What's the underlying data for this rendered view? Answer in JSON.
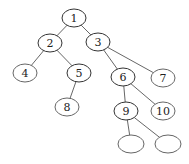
{
  "diagram": {
    "type": "binary-tree",
    "nodes": [
      {
        "id": "n1",
        "label": "1",
        "cx": 74,
        "cy": 18,
        "rx": 12,
        "ry": 9
      },
      {
        "id": "n2",
        "label": "2",
        "cx": 50,
        "cy": 43,
        "rx": 12,
        "ry": 9
      },
      {
        "id": "n3",
        "label": "3",
        "cx": 98,
        "cy": 42,
        "rx": 12,
        "ry": 9
      },
      {
        "id": "n4",
        "label": "4",
        "cx": 25,
        "cy": 73,
        "rx": 12,
        "ry": 9
      },
      {
        "id": "n5",
        "label": "5",
        "cx": 79,
        "cy": 73,
        "rx": 12,
        "ry": 9
      },
      {
        "id": "n6",
        "label": "6",
        "cx": 123,
        "cy": 77,
        "rx": 12,
        "ry": 9
      },
      {
        "id": "n7",
        "label": "7",
        "cx": 163,
        "cy": 78,
        "rx": 12,
        "ry": 9
      },
      {
        "id": "n8",
        "label": "8",
        "cx": 67,
        "cy": 107,
        "rx": 12,
        "ry": 9
      },
      {
        "id": "n9",
        "label": "9",
        "cx": 126,
        "cy": 111,
        "rx": 12,
        "ry": 9
      },
      {
        "id": "n10",
        "label": "10",
        "cx": 163,
        "cy": 111,
        "rx": 12,
        "ry": 9
      },
      {
        "id": "n11",
        "label": "",
        "cx": 131,
        "cy": 144,
        "rx": 13,
        "ry": 9
      },
      {
        "id": "n12",
        "label": "",
        "cx": 168,
        "cy": 144,
        "rx": 13,
        "ry": 9
      }
    ],
    "edges": [
      {
        "from": "n1",
        "to": "n2"
      },
      {
        "from": "n1",
        "to": "n3"
      },
      {
        "from": "n2",
        "to": "n4"
      },
      {
        "from": "n2",
        "to": "n5"
      },
      {
        "from": "n3",
        "to": "n6"
      },
      {
        "from": "n3",
        "to": "n7"
      },
      {
        "from": "n5",
        "to": "n8"
      },
      {
        "from": "n6",
        "to": "n9"
      },
      {
        "from": "n6",
        "to": "n10"
      },
      {
        "from": "n9",
        "to": "n11"
      },
      {
        "from": "n9",
        "to": "n12"
      }
    ]
  }
}
